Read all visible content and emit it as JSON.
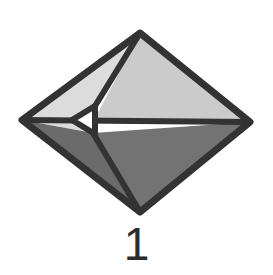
{
  "figure": {
    "name": "crystal-form-diagram",
    "caption": "1",
    "background_color": "#ffffff",
    "outline_color": "#333333",
    "outline_width": 7,
    "inner_line_color": "#333333",
    "inner_line_width": 6,
    "caption_color": "#2b2b2b"
  },
  "geometry": {
    "vertices": {
      "top": [
        140,
        33
      ],
      "right": [
        250,
        122
      ],
      "bottom": [
        140,
        212
      ],
      "left": [
        22,
        120
      ],
      "inner_left_upper": [
        95,
        106
      ],
      "inner_left_lower": [
        93,
        133
      ],
      "triangle_tip": [
        72,
        120
      ]
    },
    "midline": {
      "y": 121,
      "x_start": 22,
      "x_end": 250
    }
  },
  "facets": [
    {
      "id": "upper-left-facet",
      "label": "upper left face",
      "fill": "#dcdcdc",
      "points": "140,33 95,106 93,133 22,120"
    },
    {
      "id": "upper-right-facet",
      "label": "upper right face",
      "fill": "#cbcbcb",
      "points": "140,33 250,122 93,122"
    },
    {
      "id": "lower-left-facet",
      "label": "lower left face",
      "fill": "#6b6b6b",
      "points": "22,120 93,133 140,212"
    },
    {
      "id": "lower-right-facet",
      "label": "lower right face",
      "fill": "#737373",
      "points": "93,133 250,122 140,212"
    },
    {
      "id": "inner-white-triangle",
      "label": "small white triangle facet",
      "fill": "#ffffff",
      "points": "72,120 95,106 95,134"
    }
  ],
  "edges": [
    {
      "id": "edge-top-left",
      "label": "top left outline",
      "from": [
        140,
        33
      ],
      "to": [
        22,
        120
      ]
    },
    {
      "id": "edge-top-right",
      "label": "top right outline",
      "from": [
        140,
        33
      ],
      "to": [
        250,
        122
      ]
    },
    {
      "id": "edge-bottom-right",
      "label": "bottom right outline",
      "from": [
        250,
        122
      ],
      "to": [
        140,
        212
      ]
    },
    {
      "id": "edge-bottom-left",
      "label": "bottom left outline",
      "from": [
        140,
        212
      ],
      "to": [
        22,
        120
      ]
    },
    {
      "id": "edge-midline",
      "label": "horizontal girdle",
      "from": [
        22,
        120
      ],
      "to": [
        250,
        122
      ]
    },
    {
      "id": "edge-apex-inner",
      "label": "apex to inner vertex",
      "from": [
        140,
        33
      ],
      "to": [
        95,
        106
      ]
    },
    {
      "id": "edge-inner-bottom",
      "label": "inner vertex to base",
      "from": [
        93,
        133
      ],
      "to": [
        140,
        212
      ]
    }
  ],
  "caption": {
    "text": "1",
    "role": "figure-number"
  }
}
